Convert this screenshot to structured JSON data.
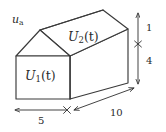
{
  "figure": {
    "kind": "house-shaped-prism-thermal-diagram",
    "projection": "oblique",
    "background_color": "#ffffff",
    "line_color": "#3a3a3a",
    "face_fill": "#ffffff",
    "text_color": "#2b2b2b"
  },
  "labels": {
    "attic_state": {
      "base": "U",
      "subscript": "2",
      "argument": "(t)",
      "full": "U2(t)"
    },
    "room_state": {
      "base": "U",
      "subscript": "1",
      "argument": "(t)",
      "full": "U1(t)"
    },
    "ambient_input": {
      "base": "u",
      "subscript": "a",
      "full": "ua"
    }
  },
  "dimensions": {
    "roof_height": {
      "value": "1",
      "orientation": "vertical",
      "position": "right-upper"
    },
    "wall_height": {
      "value": "4",
      "orientation": "vertical",
      "position": "right-lower"
    },
    "front_width": {
      "value": "5",
      "orientation": "horizontal",
      "position": "bottom-left"
    },
    "depth": {
      "value": "10",
      "orientation": "oblique",
      "position": "bottom-right"
    }
  },
  "geometry": {
    "front_bottom_left": [
      16,
      99
    ],
    "front_bottom_right": [
      70,
      99
    ],
    "front_top_left": [
      16,
      56
    ],
    "front_top_right": [
      70,
      56
    ],
    "front_apex": [
      40,
      30
    ],
    "back_top_left": [
      78,
      36
    ],
    "back_top_right": [
      128,
      29
    ],
    "back_apex": [
      103,
      10
    ],
    "back_bottom_right": [
      128,
      83
    ]
  }
}
